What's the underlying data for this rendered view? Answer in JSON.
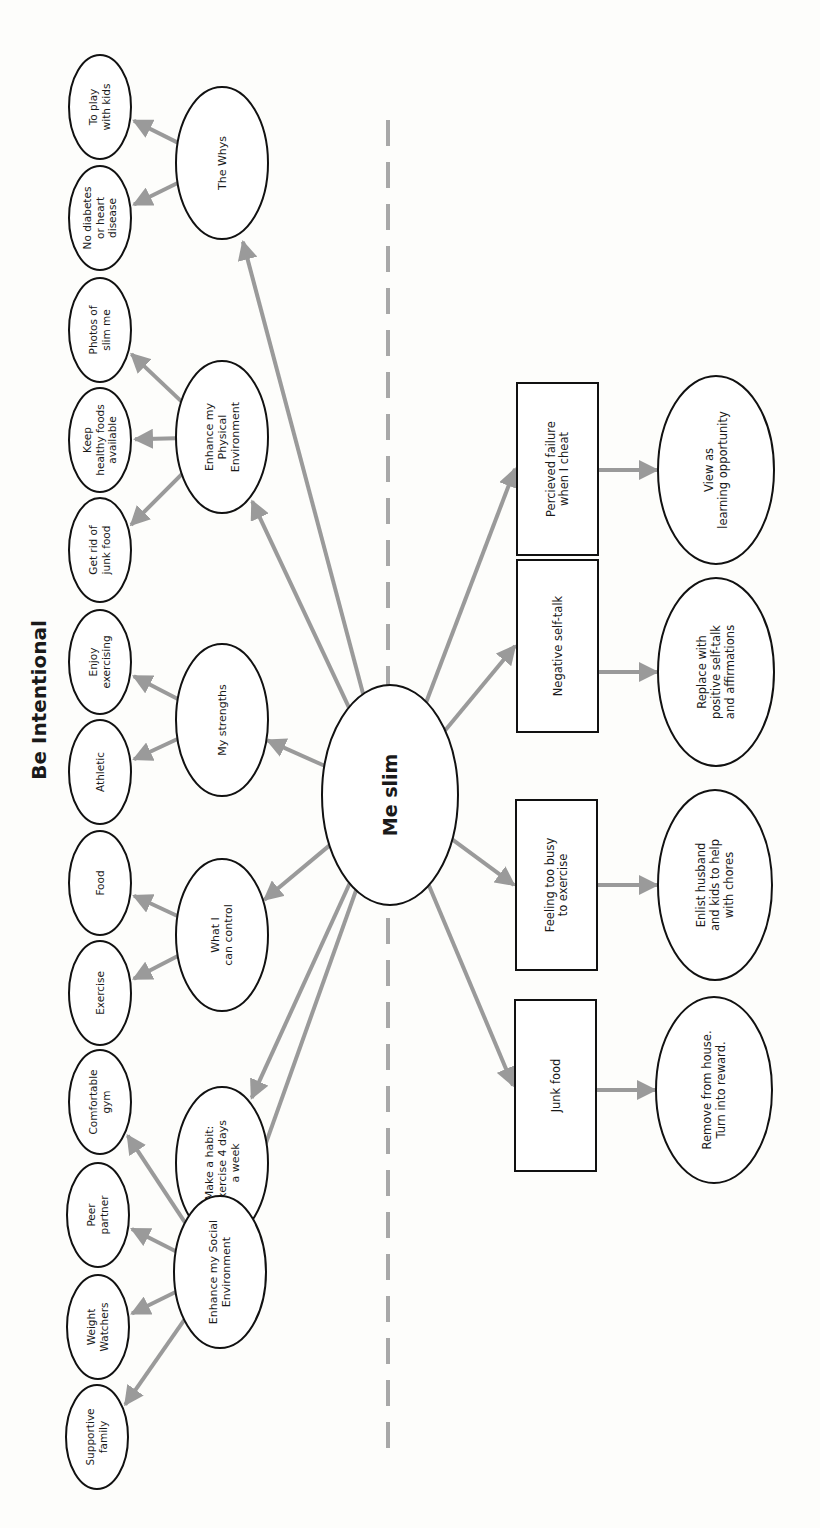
{
  "title": "Be Intentional",
  "center": {
    "label": "Me slim",
    "cx": 390,
    "cy": 795,
    "rx": 68,
    "ry": 110
  },
  "divider": {
    "x": 388,
    "y1": 120,
    "y2": 1452
  },
  "colors": {
    "arrow": "#9a9a9a",
    "stroke": "#111111",
    "divider": "#a8a8a8",
    "background": "#fdfdfb"
  },
  "branches": [
    {
      "id": "the-whys",
      "lines": [
        "The Whys"
      ],
      "cx": 222,
      "cy": 163,
      "rx": 46,
      "ry": 76,
      "leaves": [
        {
          "lines": [
            "To play",
            "with kids"
          ],
          "cx": 100,
          "cy": 107
        },
        {
          "lines": [
            "No diabetes",
            "or heart",
            "disease"
          ],
          "cx": 100,
          "cy": 218
        }
      ]
    },
    {
      "id": "enhance-physical",
      "lines": [
        "Enhance my",
        "Physical",
        "Environment"
      ],
      "cx": 222,
      "cy": 437,
      "rx": 46,
      "ry": 76,
      "leaves": [
        {
          "lines": [
            "Photos of",
            "slim me"
          ],
          "cx": 100,
          "cy": 330
        },
        {
          "lines": [
            "Keep",
            "healthy foods",
            "available"
          ],
          "cx": 100,
          "cy": 440
        },
        {
          "lines": [
            "Get rid of",
            "junk food"
          ],
          "cx": 100,
          "cy": 550
        }
      ]
    },
    {
      "id": "my-strengths",
      "lines": [
        "My strengths"
      ],
      "cx": 222,
      "cy": 720,
      "rx": 46,
      "ry": 76,
      "leaves": [
        {
          "lines": [
            "Enjoy",
            "exercising"
          ],
          "cx": 100,
          "cy": 662
        },
        {
          "lines": [
            "Athletic"
          ],
          "cx": 100,
          "cy": 772
        }
      ]
    },
    {
      "id": "what-i-can-control",
      "lines": [
        "What I",
        "can control"
      ],
      "cx": 222,
      "cy": 935,
      "rx": 46,
      "ry": 76,
      "leaves": [
        {
          "lines": [
            "Food"
          ],
          "cx": 100,
          "cy": 883
        },
        {
          "lines": [
            "Exercise"
          ],
          "cx": 100,
          "cy": 993
        }
      ]
    },
    {
      "id": "make-a-habit",
      "lines": [
        "Make a habit:",
        "Exercise 4 days",
        "a week"
      ],
      "cx": 222,
      "cy": 1163,
      "rx": 46,
      "ry": 76,
      "leaves": []
    },
    {
      "id": "enhance-social",
      "lines": [
        "Enhance my Social",
        "Environment"
      ],
      "cx": 220,
      "cy": 1272,
      "rx": 46,
      "ry": 76,
      "leaves": [
        {
          "lines": [
            "Comfortable",
            "gym"
          ],
          "cx": 100,
          "cy": 1102
        },
        {
          "lines": [
            "Peer",
            "partner"
          ],
          "cx": 98,
          "cy": 1215
        },
        {
          "lines": [
            "Weight",
            "Watchers"
          ],
          "cx": 98,
          "cy": 1327
        },
        {
          "lines": [
            "Supportive",
            "family"
          ],
          "cx": 97,
          "cy": 1437
        }
      ]
    }
  ],
  "leaf_size": {
    "rx": 31,
    "ry": 52
  },
  "obstacles": [
    {
      "id": "perceived-failure",
      "lines": [
        "Percieved failure",
        "when I cheat"
      ],
      "x": 517,
      "y": 383,
      "w": 81,
      "h": 172,
      "solution": {
        "lines": [
          "View as",
          "learning opportunity"
        ],
        "cx": 716,
        "cy": 470,
        "rx": 58,
        "ry": 94
      }
    },
    {
      "id": "negative-self-talk",
      "lines": [
        "Negative self-talk"
      ],
      "x": 517,
      "y": 560,
      "w": 81,
      "h": 172,
      "solution": {
        "lines": [
          "Replace with",
          "positive self-talk",
          "and affirmations"
        ],
        "cx": 716,
        "cy": 672,
        "rx": 58,
        "ry": 94
      }
    },
    {
      "id": "feeling-too-busy",
      "lines": [
        "Feeling too busy",
        "to exercise"
      ],
      "x": 516,
      "y": 800,
      "w": 81,
      "h": 170,
      "solution": {
        "lines": [
          "Enlist husband",
          "and kids to help",
          "with chores"
        ],
        "cx": 715,
        "cy": 885,
        "rx": 57,
        "ry": 95
      }
    },
    {
      "id": "junk-food",
      "lines": [
        "Junk food"
      ],
      "x": 515,
      "y": 1000,
      "w": 81,
      "h": 171,
      "solution": {
        "lines": [
          "Remove from house.",
          "Turn into reward."
        ],
        "cx": 714,
        "cy": 1090,
        "rx": 58,
        "ry": 93
      }
    }
  ]
}
